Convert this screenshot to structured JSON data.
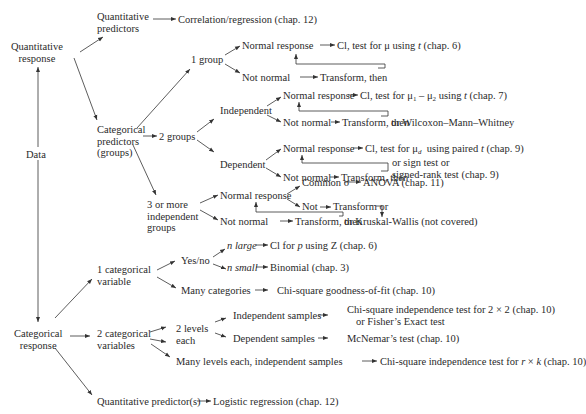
{
  "nodes": {
    "data": "Data",
    "quant_response": [
      "Quantitative",
      "response"
    ],
    "cat_response": [
      "Categorical",
      "response"
    ],
    "quant_predictors": [
      "Quantitative",
      "predictors"
    ],
    "correlation": "Correlation/regression (chap. 12)",
    "cat_predictors": [
      "Categorical",
      "predictors",
      "(groups)"
    ],
    "one_group": "1 group",
    "g1_normal": "Normal response",
    "g1_normal_result": "Cl, test for μ using t (chap. 6)",
    "g1_notnormal": "Not normal",
    "g1_transform": "Transform, then",
    "two_groups": "2 groups",
    "independent": "Independent",
    "ind_normal": "Normal response",
    "ind_normal_result": "Cl, test for μ₁ – μ₂ using t (chap. 7)",
    "ind_notnormal": "Not normal",
    "ind_transform": "Transform, then",
    "ind_alt": "or  Wilcoxon–Mann–Whitney",
    "dependent": "Dependent",
    "dep_normal": "Normal response",
    "dep_normal_result": "Cl, test for μ_d  using paired t (chap. 9)",
    "dep_notnormal": "Not normal",
    "dep_transform": "Transform, then",
    "dep_alt": [
      "or  sign test or",
      "signed-rank test (chap. 9)"
    ],
    "three_groups": [
      "3 or more",
      "independent",
      "groups"
    ],
    "g3_normal": "Normal response",
    "common_sigma": "Common σ",
    "anova": "ANOVA (chap. 11)",
    "g3_not": "Not",
    "g3_transform_or": "Transform or",
    "g3_notnormal": "Not normal",
    "g3_transform": "Transform, then",
    "kruskal": "or Kruskal-Wallis (not covered)",
    "one_cat": [
      "1 categorical",
      "variable"
    ],
    "yesno": "Yes/no",
    "n_large": "n large",
    "n_large_result": "Cl for p using Z (chap. 6)",
    "n_small": "n small",
    "n_small_result": "Binomial (chap. 3)",
    "many_categories": "Many categories",
    "gof": "Chi-square goodness-of-fit (chap. 10)",
    "two_cat": [
      "2 categorical",
      "variables"
    ],
    "two_levels": [
      "2 levels",
      "each"
    ],
    "ind_samples": "Independent samples",
    "chi2x2": [
      "Chi-square independence test for 2 × 2 (chap. 10)",
      "or Fisher’s Exact test"
    ],
    "dep_samples": "Dependent samples",
    "mcnemar": "McNemar’s test (chap. 10)",
    "many_levels": "Many levels each, independent samples",
    "chirk": "Chi-square independence test for r × k (chap. 10)",
    "quant_predictor_s": "Quantitative predictor(s)",
    "logistic": "Logistic regression (chap. 12)"
  }
}
